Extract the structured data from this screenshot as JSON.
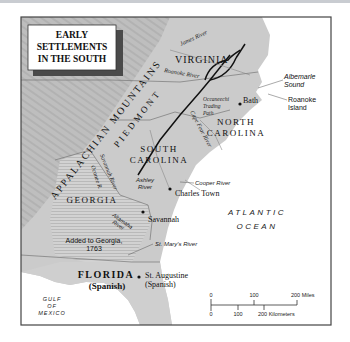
{
  "title": {
    "lines": [
      "EARLY",
      "SETTLEMENTS",
      "IN THE SOUTH"
    ]
  },
  "regions": {
    "virginia": "VIRGINIA",
    "north_carolina_1": "NORTH",
    "north_carolina_2": "CAROLINA",
    "south_carolina_1": "SOUTH",
    "south_carolina_2": "CAROLINA",
    "georgia": "GEORGIA",
    "florida": "FLORIDA",
    "florida_sub": "(Spanish)",
    "added_to_georgia_1": "Added to Georgia,",
    "added_to_georgia_2": "1763"
  },
  "physical": {
    "appalachian": "APPALACHIAN MOUNTAINS",
    "piedmont": "PIEDMONT",
    "atlantic_1": "ATLANTIC",
    "atlantic_2": "OCEAN",
    "gulf_1": "GULF",
    "gulf_2": "OF",
    "gulf_3": "MEXICO",
    "albemarle_1": "Albemarle",
    "albemarle_2": "Sound",
    "roanoke_island_1": "Roanoke",
    "roanoke_island_2": "Island"
  },
  "rivers": {
    "james": "James River",
    "roanoke": "Roanoke River",
    "cape_fear": "Cape Fear River",
    "savannah": "Savannah River",
    "oconee": "Oconee R.",
    "ashley_1": "Ashley",
    "ashley_2": "River",
    "cooper": "Cooper River",
    "altamaha_1": "Altamaha",
    "altamaha_2": "River",
    "st_marys": "St. Mary's River"
  },
  "trails": {
    "occaneechi_1": "Occaneechi",
    "occaneechi_2": "Trading",
    "occaneechi_3": "Path"
  },
  "settlements": [
    {
      "name": "Bath"
    },
    {
      "name": "Charles Town"
    },
    {
      "name": "Savannah"
    },
    {
      "name": "St. Augustine",
      "sub": "(Spanish)"
    }
  ],
  "scale": {
    "miles": [
      "0",
      "100",
      "200 Miles"
    ],
    "kilometers": [
      "0",
      "100",
      "200 Kilometers"
    ]
  },
  "colors": {
    "land": "#c9c9c9",
    "land_light": "#d6d6d6",
    "mountains": "#b8b8b8",
    "ocean": "#ffffff",
    "frame": "#333333",
    "text": "#1a1a1a"
  }
}
